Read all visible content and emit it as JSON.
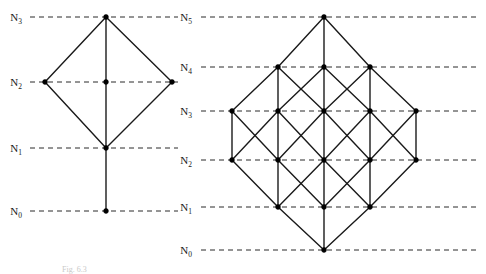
{
  "figure": {
    "caption": "Fig. 6.3",
    "background_color": "#ffffff",
    "line_color": "#1a1a1a",
    "node_color": "#000000",
    "rank_line_color": "#2b2b2b"
  },
  "diagrams": [
    {
      "id": "left-diagram",
      "name": "left-hasse-diagram",
      "rank_labels": [
        "N_0",
        "N_1",
        "N_2",
        "N_3"
      ],
      "rank_label_text": [
        "N",
        "N",
        "N",
        "N"
      ],
      "rank_label_subscripts": [
        "0",
        "1",
        "2",
        "3"
      ],
      "rank_label_x": 22,
      "rank_line_x_start": 30,
      "rank_line_x_end": 178,
      "levels": [
        {
          "label": "N_0",
          "y": 211,
          "nodes_x": [
            106
          ]
        },
        {
          "label": "N_1",
          "y": 148,
          "nodes_x": [
            106
          ]
        },
        {
          "label": "N_2",
          "y": 82,
          "nodes_x": [
            45,
            106,
            172
          ]
        },
        {
          "label": "N_3",
          "y": 17,
          "nodes_x": [
            106
          ]
        }
      ],
      "edges": [
        {
          "from": [
            106,
            211
          ],
          "to": [
            106,
            148
          ]
        },
        {
          "from": [
            106,
            148
          ],
          "to": [
            45,
            82
          ]
        },
        {
          "from": [
            106,
            148
          ],
          "to": [
            106,
            82
          ]
        },
        {
          "from": [
            106,
            148
          ],
          "to": [
            172,
            82
          ]
        },
        {
          "from": [
            45,
            82
          ],
          "to": [
            106,
            17
          ]
        },
        {
          "from": [
            106,
            82
          ],
          "to": [
            106,
            17
          ]
        },
        {
          "from": [
            172,
            82
          ],
          "to": [
            106,
            17
          ]
        }
      ]
    },
    {
      "id": "right-diagram",
      "name": "right-hasse-diagram",
      "rank_labels": [
        "N_0",
        "N_1",
        "N_2",
        "N_3",
        "N_4",
        "N_5"
      ],
      "rank_label_text": [
        "N",
        "N",
        "N",
        "N",
        "N",
        "N"
      ],
      "rank_label_subscripts": [
        "0",
        "1",
        "2",
        "3",
        "4",
        "5"
      ],
      "rank_label_x": 192,
      "rank_line_x_start": 201,
      "rank_line_x_end": 478,
      "levels": [
        {
          "label": "N_0",
          "y": 250,
          "nodes_x": [
            324
          ]
        },
        {
          "label": "N_1",
          "y": 207,
          "nodes_x": [
            278,
            324,
            370
          ]
        },
        {
          "label": "N_2",
          "y": 160,
          "nodes_x": [
            232,
            278,
            324,
            370,
            416
          ]
        },
        {
          "label": "N_3",
          "y": 111,
          "nodes_x": [
            232,
            278,
            324,
            370,
            416
          ]
        },
        {
          "label": "N_4",
          "y": 67,
          "nodes_x": [
            278,
            324,
            370
          ]
        },
        {
          "label": "N_5",
          "y": 17,
          "nodes_x": [
            324
          ]
        }
      ],
      "edges": [
        {
          "from": [
            324,
            250
          ],
          "to": [
            278,
            207
          ]
        },
        {
          "from": [
            324,
            250
          ],
          "to": [
            324,
            207
          ]
        },
        {
          "from": [
            324,
            250
          ],
          "to": [
            370,
            207
          ]
        },
        {
          "from": [
            278,
            207
          ],
          "to": [
            232,
            160
          ]
        },
        {
          "from": [
            278,
            207
          ],
          "to": [
            278,
            160
          ]
        },
        {
          "from": [
            278,
            207
          ],
          "to": [
            324,
            160
          ]
        },
        {
          "from": [
            324,
            207
          ],
          "to": [
            278,
            160
          ]
        },
        {
          "from": [
            324,
            207
          ],
          "to": [
            324,
            160
          ]
        },
        {
          "from": [
            324,
            207
          ],
          "to": [
            370,
            160
          ]
        },
        {
          "from": [
            370,
            207
          ],
          "to": [
            324,
            160
          ]
        },
        {
          "from": [
            370,
            207
          ],
          "to": [
            370,
            160
          ]
        },
        {
          "from": [
            370,
            207
          ],
          "to": [
            416,
            160
          ]
        },
        {
          "from": [
            232,
            160
          ],
          "to": [
            232,
            111
          ]
        },
        {
          "from": [
            232,
            160
          ],
          "to": [
            278,
            111
          ]
        },
        {
          "from": [
            278,
            160
          ],
          "to": [
            232,
            111
          ]
        },
        {
          "from": [
            278,
            160
          ],
          "to": [
            278,
            111
          ]
        },
        {
          "from": [
            278,
            160
          ],
          "to": [
            324,
            111
          ]
        },
        {
          "from": [
            324,
            160
          ],
          "to": [
            278,
            111
          ]
        },
        {
          "from": [
            324,
            160
          ],
          "to": [
            324,
            111
          ]
        },
        {
          "from": [
            324,
            160
          ],
          "to": [
            370,
            111
          ]
        },
        {
          "from": [
            370,
            160
          ],
          "to": [
            324,
            111
          ]
        },
        {
          "from": [
            370,
            160
          ],
          "to": [
            370,
            111
          ]
        },
        {
          "from": [
            370,
            160
          ],
          "to": [
            416,
            111
          ]
        },
        {
          "from": [
            416,
            160
          ],
          "to": [
            370,
            111
          ]
        },
        {
          "from": [
            416,
            160
          ],
          "to": [
            416,
            111
          ]
        },
        {
          "from": [
            232,
            111
          ],
          "to": [
            278,
            67
          ]
        },
        {
          "from": [
            278,
            111
          ],
          "to": [
            278,
            67
          ]
        },
        {
          "from": [
            278,
            111
          ],
          "to": [
            324,
            67
          ]
        },
        {
          "from": [
            324,
            111
          ],
          "to": [
            278,
            67
          ]
        },
        {
          "from": [
            324,
            111
          ],
          "to": [
            324,
            67
          ]
        },
        {
          "from": [
            324,
            111
          ],
          "to": [
            370,
            67
          ]
        },
        {
          "from": [
            370,
            111
          ],
          "to": [
            324,
            67
          ]
        },
        {
          "from": [
            370,
            111
          ],
          "to": [
            370,
            67
          ]
        },
        {
          "from": [
            416,
            111
          ],
          "to": [
            370,
            67
          ]
        },
        {
          "from": [
            278,
            67
          ],
          "to": [
            324,
            17
          ]
        },
        {
          "from": [
            324,
            67
          ],
          "to": [
            324,
            17
          ]
        },
        {
          "from": [
            370,
            67
          ],
          "to": [
            324,
            17
          ]
        }
      ]
    }
  ]
}
